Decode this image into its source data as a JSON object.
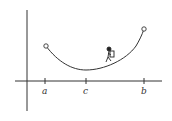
{
  "diagram": {
    "type": "function-graph",
    "axes": {
      "x_axis": true,
      "y_axis": true
    },
    "ticks": [
      {
        "label": "a",
        "x": 45
      },
      {
        "label": "c",
        "x": 86
      },
      {
        "label": "b",
        "x": 144
      }
    ],
    "endpoints": [
      {
        "name": "left-endpoint",
        "x": 46,
        "y": 46,
        "style": "open-circle"
      },
      {
        "name": "right-endpoint",
        "x": 144,
        "y": 29,
        "style": "open-circle"
      }
    ],
    "minimum": {
      "x": 86,
      "y": 70
    },
    "figure": {
      "name": "hiker",
      "x": 110,
      "y": 54
    }
  }
}
